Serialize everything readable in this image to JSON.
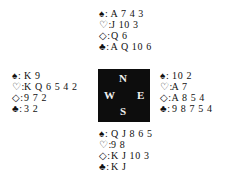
{
  "compass": {
    "north": "N",
    "south": "S",
    "east": "E",
    "west": "W",
    "background": "#0d0d0d",
    "text_color": "#f0f0f0"
  },
  "hands": {
    "north": {
      "spades": "A 7 4 3",
      "hearts": "J 10 3",
      "diamonds": "Q 6",
      "clubs": "A Q 10 6"
    },
    "west": {
      "spades": "K 9",
      "hearts": "K Q 6 5 4 2",
      "diamonds": "9 7 2",
      "clubs": "3 2"
    },
    "east": {
      "spades": "10 2",
      "hearts": "A 7",
      "diamonds": "A 8 5 4",
      "clubs": "9 8 7 5 4"
    },
    "south": {
      "spades": "Q J 8 6 5",
      "hearts": "9 8",
      "diamonds": "K J 10 3",
      "clubs": "K J"
    }
  },
  "symbols": {
    "spades": "♠:",
    "hearts": "♡:",
    "diamonds": "◇:",
    "clubs": "♣:"
  }
}
